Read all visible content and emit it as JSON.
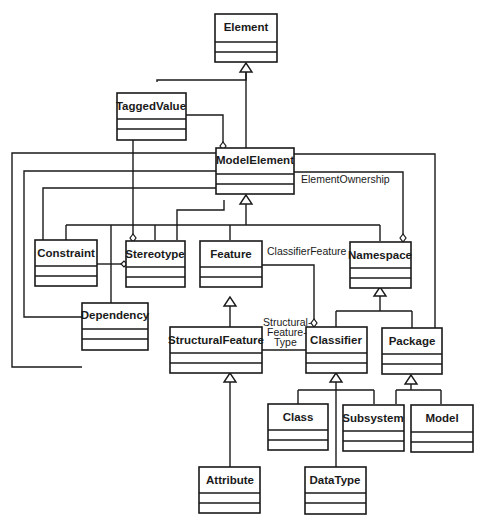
{
  "diagram": {
    "type": "UML class diagram",
    "classes": {
      "element": "Element",
      "tagged_value": "TaggedValue",
      "model_element": "ModelElement",
      "constraint": "Constraint",
      "stereotype": "Stereotype",
      "feature": "Feature",
      "namespace": "Namespace",
      "dependency": "Dependency",
      "structural_feature": "StructuralFeature",
      "classifier": "Classifier",
      "package": "Package",
      "class": "Class",
      "subsystem": "Subsystem",
      "model": "Model",
      "attribute": "Attribute",
      "data_type": "DataType"
    },
    "associations": {
      "element_ownership": "ElementOwnership",
      "classifier_feature": "ClassifierFeature",
      "structural_feature_type_line1": "Structural-",
      "structural_feature_type_line2": "Feature-",
      "structural_feature_type_line3": "Type"
    },
    "generalizations": [
      {
        "child": "TaggedValue",
        "parent": "Element"
      },
      {
        "child": "ModelElement",
        "parent": "Element"
      },
      {
        "child": "Constraint",
        "parent": "ModelElement"
      },
      {
        "child": "Stereotype",
        "parent": "ModelElement"
      },
      {
        "child": "Feature",
        "parent": "ModelElement"
      },
      {
        "child": "Namespace",
        "parent": "ModelElement"
      },
      {
        "child": "Dependency",
        "parent": "ModelElement"
      },
      {
        "child": "StructuralFeature",
        "parent": "Feature"
      },
      {
        "child": "Classifier",
        "parent": "Namespace"
      },
      {
        "child": "Package",
        "parent": "Namespace"
      },
      {
        "child": "Attribute",
        "parent": "StructuralFeature"
      },
      {
        "child": "Class",
        "parent": "Classifier"
      },
      {
        "child": "DataType",
        "parent": "Classifier"
      },
      {
        "child": "Subsystem",
        "parent": "Package"
      },
      {
        "child": "Model",
        "parent": "Package"
      }
    ]
  }
}
